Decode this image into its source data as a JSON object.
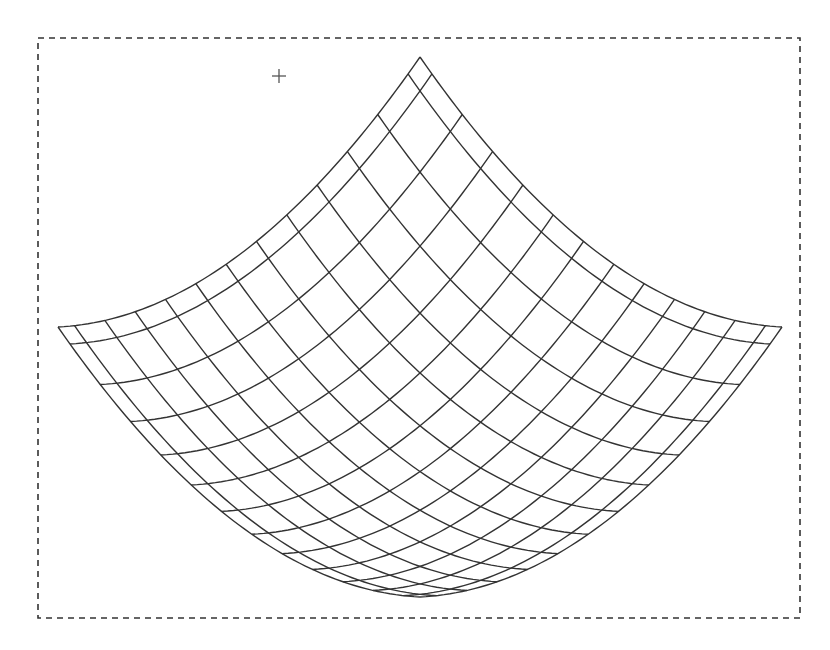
{
  "canvas": {
    "width": 830,
    "height": 650,
    "background": "#ffffff"
  },
  "selection_frame": {
    "x": 38,
    "y": 38,
    "width": 762,
    "height": 580,
    "style": "dashed",
    "color": "#333333"
  },
  "cursor": {
    "icon": "crosshair-icon",
    "x": 279,
    "y": 76,
    "size": 14,
    "color": "#555555"
  },
  "mesh": {
    "description": "wireframe bowl surface, isometric view",
    "line_color": "#333333",
    "projection": {
      "center_x": 420,
      "center_y": 327,
      "x_scale": 181,
      "depth_scale": 135,
      "height_scale": 63
    },
    "domain": [
      -1,
      1
    ],
    "grid_start": -0.934,
    "grid_step": 0.1675,
    "grid_lines_per_direction": 12,
    "corners": {
      "top": [
        418,
        57
      ],
      "left": [
        57,
        326
      ],
      "right": [
        782,
        327
      ],
      "bottom": [
        418,
        597
      ]
    }
  }
}
